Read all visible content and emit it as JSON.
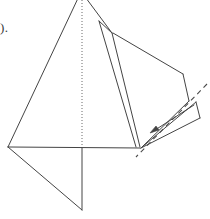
{
  "figure": {
    "label_fragment": ").",
    "stroke_color": "#444444",
    "accent_color": "#555555",
    "background_color": "#ffffff",
    "stroke_width": 1,
    "dotted_axis": {
      "name": "axis-of-symmetry",
      "style": "dotted",
      "x": 82,
      "y_top": 0,
      "y_bottom": 147
    },
    "baseline": {
      "name": "horizontal-baseline",
      "x1": 8,
      "y1": 147,
      "x2": 140,
      "y2": 148
    },
    "main_triangle": {
      "name": "main-triangle",
      "points": "80,-6 8,147 140,148"
    },
    "lower_flap": {
      "name": "lower-triangular-flap",
      "points": "8,147 82,210 82,148"
    },
    "center_sliver": {
      "name": "center-sliver-fold",
      "points": "99,21 112,33 140,147 136,147"
    },
    "sliver_inner_edge": {
      "name": "sliver-inner-edge",
      "x1": 99,
      "y1": 21,
      "x2": 136,
      "y2": 147
    },
    "right_panel": {
      "name": "right-folded-panel",
      "points": "113,33 183,74 189,101 141,148"
    },
    "panel_top_edge": {
      "name": "panel-top-edge",
      "x1": 113,
      "y1": 33,
      "x2": 183,
      "y2": 74
    },
    "wedge_upper": {
      "name": "wedge-upper-edge",
      "x1": 141,
      "y1": 148,
      "x2": 196,
      "y2": 102
    },
    "wedge_lower": {
      "name": "wedge-lower-edge",
      "x1": 141,
      "y1": 148,
      "x2": 200,
      "y2": 118
    },
    "wedge_tip": {
      "name": "wedge-tip-edge",
      "x1": 196,
      "y1": 102,
      "x2": 200,
      "y2": 118
    },
    "dashed_fold_line": {
      "name": "dashed-fold-line",
      "style": "dashed",
      "x1": 207,
      "y1": 84,
      "x2": 136,
      "y2": 157
    },
    "fold_arrow": {
      "name": "fold-direction-arrow",
      "x1": 194,
      "y1": 105,
      "x2": 150,
      "y2": 133,
      "head_size": 7
    }
  }
}
